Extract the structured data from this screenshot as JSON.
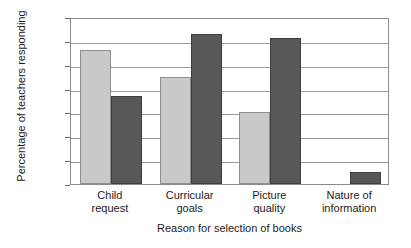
{
  "chart_data": {
    "type": "bar",
    "title": "",
    "xlabel": "Reason for selection of books",
    "ylabel": "Percentage of teachers responding",
    "categories": [
      "Child request",
      "Curricular goals",
      "Picture quality",
      "Nature of information"
    ],
    "category_lines": [
      [
        "Child",
        "request"
      ],
      [
        "Curricular",
        "goals"
      ],
      [
        "Picture",
        "quality"
      ],
      [
        "Nature of",
        "information"
      ]
    ],
    "series": [
      {
        "name": "Series 1",
        "color": "#c9c9c9",
        "values": [
          56,
          45,
          30,
          0
        ]
      },
      {
        "name": "Series 2",
        "color": "#585858",
        "values": [
          37,
          63,
          61,
          5
        ]
      }
    ],
    "ylim": [
      0,
      70
    ],
    "ytick_values": [
      0,
      10,
      20,
      30,
      40,
      50,
      60,
      70
    ],
    "ytick_labels": [
      "0",
      "10",
      "20",
      "30",
      "40",
      "50",
      "60",
      "70"
    ],
    "grid": true,
    "grid_axis": "y",
    "legend": "none",
    "bar_group_count": 4,
    "bars_per_group": 2
  },
  "axes": {
    "frame_color": "#8a8a8a",
    "gridline_color": "#9a9a9a",
    "tick_color": "#6e6e6e",
    "text_color": "#1b1b1b",
    "background": "#ffffff"
  }
}
